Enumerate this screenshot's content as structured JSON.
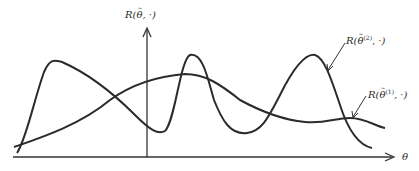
{
  "diagram": {
    "y_axis_label": {
      "prefix": "R(",
      "symbol": "θ",
      "accent": "~",
      "suffix": ", ·)"
    },
    "x_axis_label": "θ",
    "curves": [
      {
        "id": "curve-theta-2",
        "label_prefix": "R(",
        "symbol": "θ",
        "accent": "~",
        "superscript": "(2)",
        "suffix": ", ·)"
      },
      {
        "id": "curve-theta-1",
        "label_prefix": "R(",
        "symbol": "θ",
        "accent": "~",
        "superscript": "(1)",
        "suffix": ", ·)"
      }
    ],
    "colors": {
      "line": "#2b2b2b",
      "axis": "#333333",
      "background": "#ffffff"
    }
  }
}
